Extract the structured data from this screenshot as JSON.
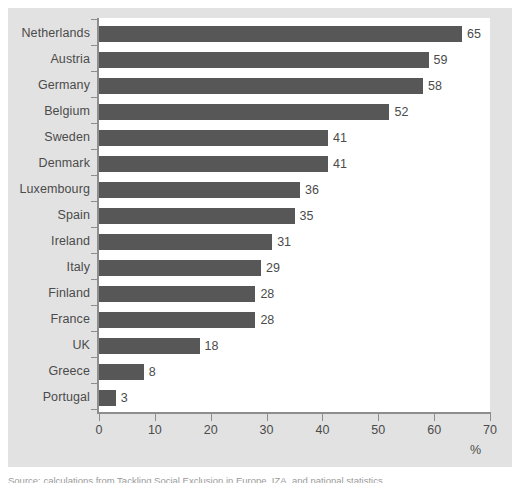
{
  "figure": {
    "percent_axis_label": "%",
    "source_caption": "Source: calculations from Tackling Social Exclusion in Europe, IZA, and national statistics"
  },
  "chart_data": {
    "type": "bar",
    "orientation": "horizontal",
    "title": "",
    "xlabel": "%",
    "ylabel": "",
    "xlim": [
      0,
      70
    ],
    "xticks": [
      0,
      10,
      20,
      30,
      40,
      50,
      60,
      70
    ],
    "grid": false,
    "legend": null,
    "bar_color": "#575757",
    "plot_background": "#ffffff",
    "panel_background": "#e2e2e2",
    "axis_color": "#8d8d8d",
    "text_color": "#4b4b4b",
    "categories": [
      "Netherlands",
      "Austria",
      "Germany",
      "Belgium",
      "Sweden",
      "Denmark",
      "Luxembourg",
      "Spain",
      "Ireland",
      "Italy",
      "Finland",
      "France",
      "UK",
      "Greece",
      "Portugal"
    ],
    "values": [
      65,
      59,
      58,
      52,
      41,
      41,
      36,
      35,
      31,
      29,
      28,
      28,
      18,
      8,
      3
    ],
    "data_labels": [
      "65",
      "59",
      "58",
      "52",
      "41",
      "41",
      "36",
      "35",
      "31",
      "29",
      "28",
      "28",
      "18",
      "8",
      "3"
    ],
    "xtick_labels": [
      "0",
      "10",
      "20",
      "30",
      "40",
      "50",
      "60",
      "70"
    ]
  }
}
